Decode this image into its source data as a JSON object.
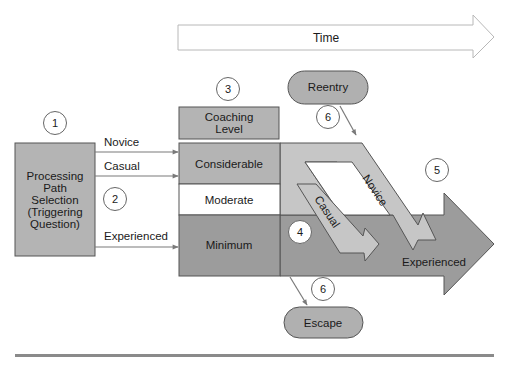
{
  "colors": {
    "background": "#ffffff",
    "box_gray": "#b4b4b4",
    "dark_gray": "#9a9a9a",
    "light_band": "#c6c6c6",
    "pill_gray": "#b0b0b0",
    "stroke": "#555555",
    "line_gray": "#7a7a7a",
    "rule_gray": "#8a8a8a"
  },
  "time_arrow": {
    "label": "Time"
  },
  "processing_box": {
    "lines": [
      "Processing",
      "Path",
      "Selection",
      "(Triggering",
      "Question)"
    ]
  },
  "paths": [
    {
      "label": "Novice"
    },
    {
      "label": "Casual"
    },
    {
      "label": "Experienced"
    }
  ],
  "coaching": {
    "header_lines": [
      "Coaching",
      "Level"
    ],
    "levels": [
      {
        "label": "Considerable"
      },
      {
        "label": "Moderate"
      },
      {
        "label": "Minimum"
      }
    ]
  },
  "flow_arrows": {
    "novice": "Novice",
    "casual": "Casual",
    "experienced": "Experienced"
  },
  "pills": {
    "reentry": "Reentry",
    "escape": "Escape"
  },
  "markers": {
    "m1": "1",
    "m2": "2",
    "m3": "3",
    "m4": "4",
    "m5": "5",
    "m6_top": "6",
    "m6_bottom": "6"
  }
}
